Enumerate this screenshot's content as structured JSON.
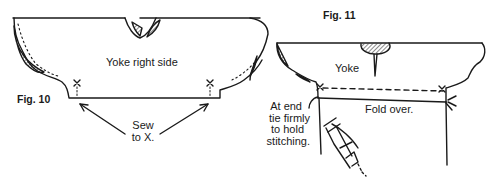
{
  "figures": [
    {
      "id": "fig10",
      "caption": "Fig. 10",
      "labels": {
        "yoke": "Yoke right side",
        "instruction_line1": "Sew",
        "instruction_line2": "to X."
      },
      "marks": [
        "X",
        "X"
      ]
    },
    {
      "id": "fig11",
      "caption": "Fig. 11",
      "labels": {
        "yoke": "Yoke",
        "fold": "Fold over.",
        "note_line1": "At end",
        "note_line2": "tie firmly",
        "note_line3": "to hold",
        "note_line4": "stitching."
      },
      "marks": [
        "X",
        "X"
      ]
    }
  ],
  "colors": {
    "ink": "#1a1a1a",
    "paper": "#ffffff"
  }
}
